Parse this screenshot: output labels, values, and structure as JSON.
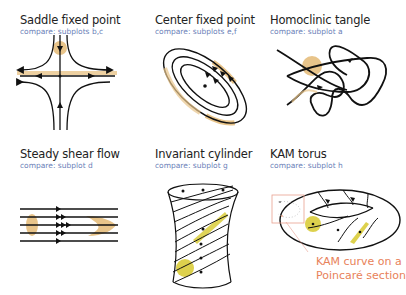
{
  "top_caption": "",
  "panels": [
    {
      "title": "Saddle fixed point",
      "compare": "compare: subplots b,c",
      "icon": "saddle-diagram"
    },
    {
      "title": "Center fixed point",
      "compare": "compare: subplots e,f",
      "icon": "center-diagram"
    },
    {
      "title": "Homoclinic tangle",
      "compare": "compare: subplot a",
      "icon": "tangle-diagram"
    },
    {
      "title": "Steady shear flow",
      "compare": "compare: subplot d",
      "icon": "shear-diagram"
    },
    {
      "title": "Invariant cylinder",
      "compare": "compare: subplot g",
      "icon": "cylinder-diagram"
    },
    {
      "title": "KAM torus",
      "compare": "compare: subplot h",
      "icon": "torus-diagram"
    }
  ],
  "callout": {
    "line1": "KAM curve on a",
    "line2": "Poincaré section"
  },
  "colors": {
    "blob": "#e8c48a",
    "yellow": "#d9cc3a",
    "accent": "#e8825a",
    "sub": "#6b7fb8"
  }
}
